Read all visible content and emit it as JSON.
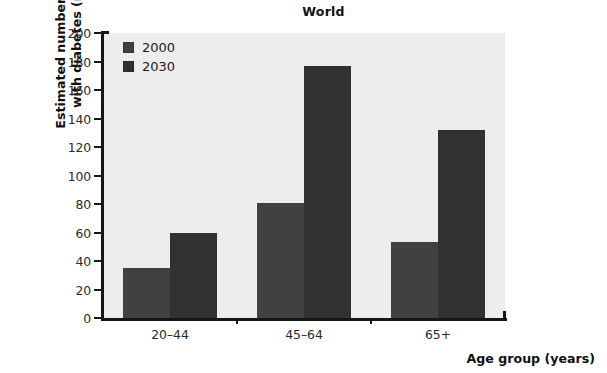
{
  "chart_data": {
    "type": "bar",
    "title": "World",
    "xlabel": "Age group (years)",
    "ylabel": "Estimated numbers of people\nwith diabetes (millions)",
    "categories": [
      "20–44",
      "45–64",
      "65+"
    ],
    "series": [
      {
        "name": "2000",
        "values": [
          35,
          81,
          53
        ],
        "color": "#414141"
      },
      {
        "name": "2030",
        "values": [
          60,
          177,
          132
        ],
        "color": "#313131"
      }
    ],
    "ylim": [
      0,
      200
    ],
    "ytick_step": 20,
    "yticks": [
      200,
      180,
      160,
      140,
      120,
      100,
      80,
      60,
      40,
      20,
      0
    ],
    "grid": false,
    "legend_position": "upper-left-inside",
    "plot_background": "#ededed",
    "axis_color": "#161616"
  },
  "legend": {
    "entries": [
      {
        "label": "2000",
        "swatch": "#414141"
      },
      {
        "label": "2030",
        "swatch": "#313131"
      }
    ]
  }
}
